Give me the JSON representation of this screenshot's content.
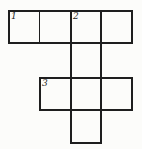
{
  "figure": {
    "colors": {
      "line": "#1e1e1e",
      "background": "#fcfcfa"
    },
    "grid": {
      "rows": 4,
      "cols": 4,
      "cells": [
        {
          "row": 1,
          "col": 1,
          "number": "1"
        },
        {
          "row": 1,
          "col": 2,
          "number": ""
        },
        {
          "row": 1,
          "col": 3,
          "number": "2"
        },
        {
          "row": 1,
          "col": 4,
          "number": ""
        },
        {
          "row": 2,
          "col": 3,
          "number": ""
        },
        {
          "row": 3,
          "col": 2,
          "number": "3"
        },
        {
          "row": 3,
          "col": 3,
          "number": ""
        },
        {
          "row": 3,
          "col": 4,
          "number": ""
        },
        {
          "row": 4,
          "col": 3,
          "number": ""
        }
      ],
      "words": [
        {
          "id": "1-across",
          "number": "1",
          "direction": "across",
          "row": 1,
          "col": 1,
          "length": 4
        },
        {
          "id": "2-down",
          "number": "2",
          "direction": "down",
          "row": 1,
          "col": 3,
          "length": 4
        },
        {
          "id": "3-across",
          "number": "3",
          "direction": "across",
          "row": 3,
          "col": 2,
          "length": 3
        }
      ]
    }
  }
}
